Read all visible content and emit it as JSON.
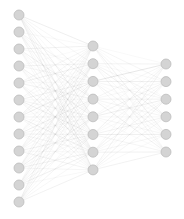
{
  "figure": {
    "width": 184,
    "height": 219,
    "background_color": "#ffffff"
  },
  "style": {
    "node_fill": "#d4d4d4",
    "node_stroke": "#bdbdbd",
    "node_radius": 5.0,
    "edge_color": "#8c8c8c",
    "edge_min_opacity": 0.06,
    "edge_max_opacity": 0.55,
    "edge_width": 0.45
  },
  "chart_data": {
    "type": "diagram",
    "subtype": "neural-network-graph",
    "title": "",
    "layers": [
      {
        "name": "input-layer",
        "label": "Input layer",
        "node_count": 12,
        "x": 19,
        "y_start": 15,
        "y_spacing": 17.0
      },
      {
        "name": "hidden-layer",
        "label": "Hidden layer",
        "node_count": 8,
        "x": 93,
        "y_start": 46,
        "y_spacing": 17.7
      },
      {
        "name": "output-layer",
        "label": "Output layer",
        "node_count": 6,
        "x": 166,
        "y_start": 64,
        "y_spacing": 17.6
      }
    ],
    "edges": [
      {
        "from_layer": 0,
        "to_layer": 1,
        "links": [
          [
            0,
            0,
            0.52
          ],
          [
            0,
            1,
            0.18
          ],
          [
            0,
            2,
            0.4
          ],
          [
            0,
            3,
            0.11
          ],
          [
            0,
            4,
            0.47
          ],
          [
            0,
            5,
            0.22
          ],
          [
            0,
            6,
            0.35
          ],
          [
            0,
            7,
            0.44
          ],
          [
            1,
            0,
            0.14
          ],
          [
            1,
            2,
            0.33
          ],
          [
            1,
            3,
            0.26
          ],
          [
            1,
            4,
            0.09
          ],
          [
            1,
            5,
            0.41
          ],
          [
            1,
            6,
            0.17
          ],
          [
            1,
            7,
            0.3
          ],
          [
            2,
            0,
            0.38
          ],
          [
            2,
            1,
            0.12
          ],
          [
            2,
            3,
            0.45
          ],
          [
            2,
            4,
            0.2
          ],
          [
            2,
            5,
            0.08
          ],
          [
            2,
            6,
            0.28
          ],
          [
            2,
            7,
            0.16
          ],
          [
            3,
            0,
            0.1
          ],
          [
            3,
            1,
            0.36
          ],
          [
            3,
            2,
            0.24
          ],
          [
            3,
            4,
            0.43
          ],
          [
            3,
            5,
            0.15
          ],
          [
            3,
            6,
            0.31
          ],
          [
            3,
            7,
            0.07
          ],
          [
            4,
            0,
            0.29
          ],
          [
            4,
            1,
            0.46
          ],
          [
            4,
            2,
            0.13
          ],
          [
            4,
            3,
            0.34
          ],
          [
            4,
            5,
            0.21
          ],
          [
            4,
            6,
            0.5
          ],
          [
            4,
            7,
            0.19
          ],
          [
            5,
            0,
            0.23
          ],
          [
            5,
            1,
            0.09
          ],
          [
            5,
            2,
            0.39
          ],
          [
            5,
            3,
            0.17
          ],
          [
            5,
            4,
            0.32
          ],
          [
            5,
            5,
            0.48
          ],
          [
            5,
            6,
            0.11
          ],
          [
            5,
            7,
            0.27
          ],
          [
            6,
            0,
            0.42
          ],
          [
            6,
            1,
            0.25
          ],
          [
            6,
            2,
            0.54
          ],
          [
            6,
            3,
            0.08
          ],
          [
            6,
            4,
            0.37
          ],
          [
            6,
            5,
            0.14
          ],
          [
            6,
            6,
            0.45
          ],
          [
            6,
            7,
            0.2
          ],
          [
            7,
            0,
            0.16
          ],
          [
            7,
            1,
            0.31
          ],
          [
            7,
            2,
            0.1
          ],
          [
            7,
            3,
            0.49
          ],
          [
            7,
            4,
            0.22
          ],
          [
            7,
            5,
            0.35
          ],
          [
            7,
            6,
            0.27
          ],
          [
            7,
            7,
            0.12
          ],
          [
            8,
            0,
            0.33
          ],
          [
            8,
            1,
            0.19
          ],
          [
            8,
            2,
            0.44
          ],
          [
            8,
            3,
            0.28
          ],
          [
            8,
            4,
            0.07
          ],
          [
            8,
            5,
            0.4
          ],
          [
            8,
            6,
            0.15
          ],
          [
            8,
            7,
            0.36
          ],
          [
            9,
            0,
            0.21
          ],
          [
            9,
            1,
            0.47
          ],
          [
            9,
            2,
            0.13
          ],
          [
            9,
            3,
            0.3
          ],
          [
            9,
            4,
            0.51
          ],
          [
            9,
            5,
            0.18
          ],
          [
            9,
            6,
            0.38
          ],
          [
            9,
            7,
            0.24
          ],
          [
            10,
            0,
            0.09
          ],
          [
            10,
            1,
            0.26
          ],
          [
            10,
            2,
            0.41
          ],
          [
            10,
            3,
            0.12
          ],
          [
            10,
            4,
            0.34
          ],
          [
            10,
            5,
            0.29
          ],
          [
            10,
            6,
            0.46
          ],
          [
            10,
            7,
            0.17
          ],
          [
            11,
            0,
            0.37
          ],
          [
            11,
            1,
            0.15
          ],
          [
            11,
            2,
            0.23
          ],
          [
            11,
            3,
            0.43
          ],
          [
            11,
            4,
            0.11
          ],
          [
            11,
            5,
            0.32
          ],
          [
            11,
            6,
            0.2
          ],
          [
            11,
            7,
            0.39
          ]
        ]
      },
      {
        "from_layer": 1,
        "to_layer": 2,
        "links": [
          [
            0,
            0,
            0.14
          ],
          [
            0,
            1,
            0.3
          ],
          [
            0,
            2,
            0.09
          ],
          [
            0,
            3,
            0.22
          ],
          [
            0,
            4,
            0.41
          ],
          [
            0,
            5,
            0.16
          ],
          [
            1,
            0,
            0.36
          ],
          [
            1,
            1,
            0.11
          ],
          [
            1,
            2,
            0.27
          ],
          [
            1,
            3,
            0.45
          ],
          [
            1,
            4,
            0.13
          ],
          [
            1,
            5,
            0.33
          ],
          [
            2,
            0,
            0.19
          ],
          [
            2,
            1,
            0.48
          ],
          [
            2,
            2,
            0.24
          ],
          [
            2,
            3,
            0.08
          ],
          [
            2,
            4,
            0.31
          ],
          [
            2,
            5,
            0.2
          ],
          [
            2,
            0,
            0.52
          ],
          [
            3,
            0,
            0.25
          ],
          [
            3,
            1,
            0.15
          ],
          [
            3,
            2,
            0.38
          ],
          [
            3,
            3,
            0.29
          ],
          [
            3,
            4,
            0.1
          ],
          [
            3,
            5,
            0.43
          ],
          [
            4,
            0,
            0.12
          ],
          [
            4,
            1,
            0.34
          ],
          [
            4,
            2,
            0.47
          ],
          [
            4,
            3,
            0.18
          ],
          [
            4,
            4,
            0.26
          ],
          [
            4,
            5,
            0.09
          ],
          [
            5,
            0,
            0.4
          ],
          [
            5,
            1,
            0.21
          ],
          [
            5,
            2,
            0.13
          ],
          [
            5,
            3,
            0.37
          ],
          [
            5,
            4,
            0.5
          ],
          [
            5,
            5,
            0.28
          ],
          [
            6,
            0,
            0.17
          ],
          [
            6,
            1,
            0.42
          ],
          [
            6,
            2,
            0.32
          ],
          [
            6,
            3,
            0.11
          ],
          [
            6,
            4,
            0.23
          ],
          [
            6,
            5,
            0.46
          ],
          [
            7,
            0,
            0.35
          ],
          [
            7,
            1,
            0.1
          ],
          [
            7,
            2,
            0.44
          ],
          [
            7,
            3,
            0.26
          ],
          [
            7,
            4,
            0.14
          ],
          [
            7,
            5,
            0.39
          ]
        ]
      }
    ]
  }
}
